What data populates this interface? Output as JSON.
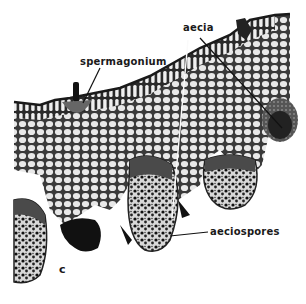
{
  "figure": {
    "panel_letter": "c",
    "labels": {
      "spermagonium": "spermagonium",
      "aecia": "aecia",
      "aeciospores": "aeciospores"
    }
  }
}
